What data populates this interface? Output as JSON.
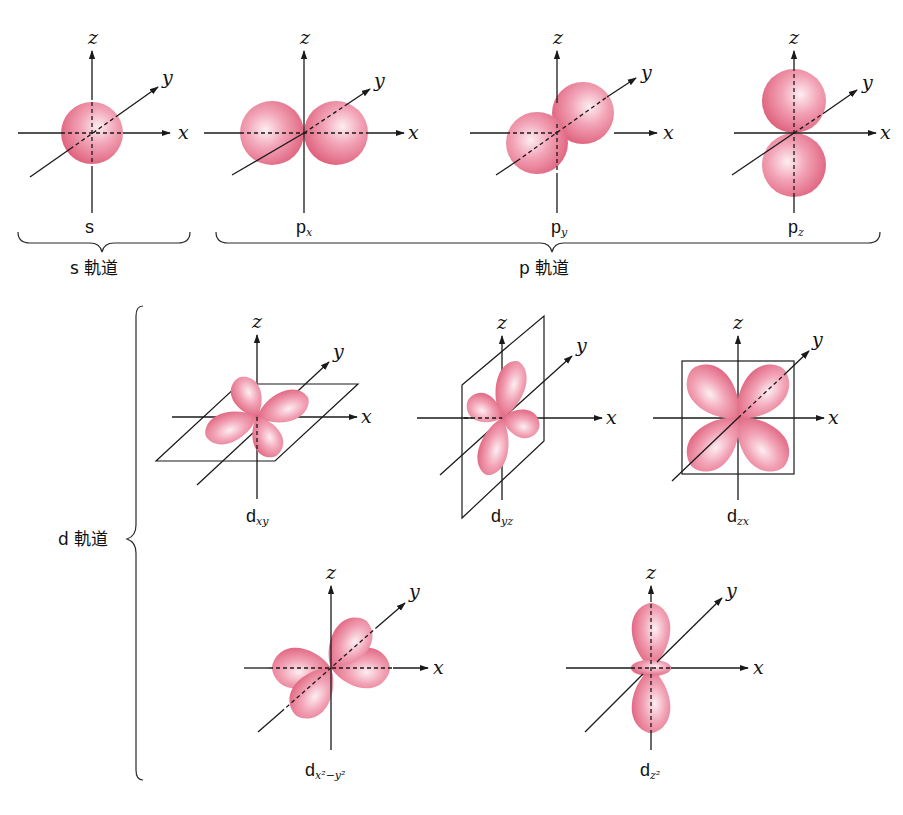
{
  "colors": {
    "lobe": "#e87a93",
    "lobe_highlight": "#fbe3ea",
    "lobe_edge": "#d9566f",
    "ink": "#1a1a1a"
  },
  "axes": {
    "x": "x",
    "y": "y",
    "z": "z"
  },
  "groups": {
    "s": {
      "label": "s 軌道"
    },
    "p": {
      "label": "p 軌道"
    },
    "d": {
      "label": "d 軌道"
    }
  },
  "orbitals": [
    {
      "id": "s",
      "main": "s",
      "sub": ""
    },
    {
      "id": "px",
      "main": "p",
      "sub": "x"
    },
    {
      "id": "py",
      "main": "p",
      "sub": "y"
    },
    {
      "id": "pz",
      "main": "p",
      "sub": "z"
    },
    {
      "id": "dxy",
      "main": "d",
      "sub": "xy"
    },
    {
      "id": "dyz",
      "main": "d",
      "sub": "yz"
    },
    {
      "id": "dzx",
      "main": "d",
      "sub": "zx"
    },
    {
      "id": "dx2y2",
      "main": "d",
      "sub": "x²−y²"
    },
    {
      "id": "dz2",
      "main": "d",
      "sub": "z²"
    }
  ]
}
